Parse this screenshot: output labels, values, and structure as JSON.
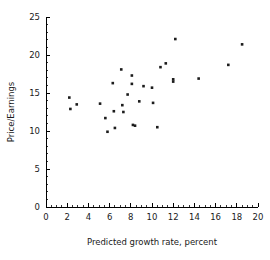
{
  "chart_data": {
    "type": "scatter",
    "title": "",
    "xlabel": "Predicted growth rate, percent",
    "ylabel": "Price/Earnings",
    "xlim": [
      0,
      20
    ],
    "ylim": [
      0,
      25
    ],
    "xticks": [
      0,
      2,
      4,
      6,
      8,
      10,
      12,
      14,
      16,
      18,
      20
    ],
    "yticks": [
      0,
      5,
      10,
      15,
      20,
      25
    ],
    "xtick_labels": [
      "0",
      "2",
      "4",
      "6",
      "8",
      "10",
      "12",
      "14",
      "16",
      "18",
      "20"
    ],
    "ytick_labels": [
      "0",
      "5",
      "10",
      "15",
      "20",
      "25"
    ],
    "x_minor_tick_step": 0.5,
    "y_minor_tick_step": 1,
    "grid": false,
    "legend": false,
    "marker": "square",
    "marker_color": "#1c1c1c",
    "marker_size_px": 2.6,
    "points": [
      {
        "x": 2.2,
        "y": 14.4
      },
      {
        "x": 2.3,
        "y": 12.9
      },
      {
        "x": 2.9,
        "y": 13.5
      },
      {
        "x": 5.1,
        "y": 13.6
      },
      {
        "x": 5.6,
        "y": 11.7
      },
      {
        "x": 5.8,
        "y": 9.9
      },
      {
        "x": 6.3,
        "y": 16.3
      },
      {
        "x": 6.4,
        "y": 12.6
      },
      {
        "x": 6.5,
        "y": 10.4
      },
      {
        "x": 7.1,
        "y": 18.1
      },
      {
        "x": 7.2,
        "y": 13.4
      },
      {
        "x": 7.3,
        "y": 12.5
      },
      {
        "x": 7.7,
        "y": 14.8
      },
      {
        "x": 8.1,
        "y": 17.3
      },
      {
        "x": 8.1,
        "y": 16.2
      },
      {
        "x": 8.2,
        "y": 10.8
      },
      {
        "x": 8.4,
        "y": 10.7
      },
      {
        "x": 8.8,
        "y": 13.9
      },
      {
        "x": 9.2,
        "y": 15.9
      },
      {
        "x": 10.0,
        "y": 15.7
      },
      {
        "x": 10.1,
        "y": 13.7
      },
      {
        "x": 10.5,
        "y": 10.5
      },
      {
        "x": 10.8,
        "y": 18.4
      },
      {
        "x": 11.3,
        "y": 18.9
      },
      {
        "x": 12.0,
        "y": 16.8
      },
      {
        "x": 12.0,
        "y": 16.5
      },
      {
        "x": 12.2,
        "y": 22.1
      },
      {
        "x": 14.4,
        "y": 16.9
      },
      {
        "x": 17.2,
        "y": 18.7
      },
      {
        "x": 18.5,
        "y": 21.4
      }
    ]
  },
  "geometry": {
    "x_origin_px": 46,
    "y_origin_px": 207,
    "x_max_px": 258,
    "y_max_px": 17
  }
}
